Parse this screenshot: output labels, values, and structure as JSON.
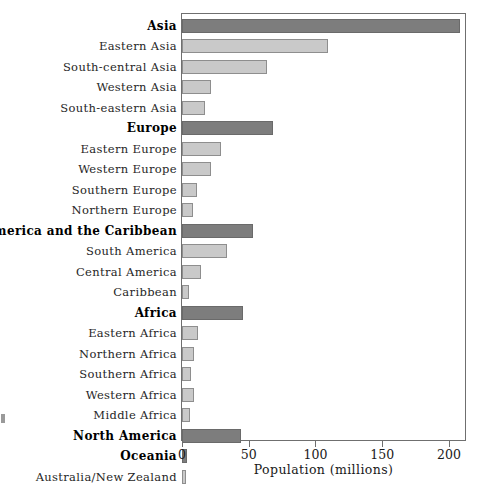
{
  "chart_data": {
    "type": "bar",
    "orientation": "horizontal",
    "title": "",
    "xlabel": "Population (millions)",
    "ylabel": "",
    "xlim": [
      0,
      212
    ],
    "xticks": [
      0,
      50,
      100,
      150,
      200
    ],
    "xticklabels": [
      "0",
      "50",
      "100",
      "150",
      "200"
    ],
    "grid": false,
    "legend": null,
    "colors": {
      "major_region_fill": "#7d7d7d",
      "sub_region_fill": "#c9c9c9",
      "bar_border": "#8e8e8e",
      "frame": "#6f6f6f",
      "background": "#ffffff"
    },
    "categories": [
      "Asia",
      "Eastern Asia",
      "South-central Asia",
      "Western Asia",
      "South-eastern Asia",
      "Europe",
      "Eastern Europe",
      "Western Europe",
      "Southern Europe",
      "Northern Europe",
      "Latin America and the Caribbean",
      "South America",
      "Central America",
      "Caribbean",
      "Africa",
      "Eastern Africa",
      "Northern Africa",
      "Southern Africa",
      "Western Africa",
      "Middle Africa",
      "North America",
      "Oceania",
      "Australia/New Zealand"
    ],
    "values": [
      208,
      109,
      64,
      22,
      17,
      68,
      29,
      22,
      11,
      8,
      53,
      34,
      14,
      5,
      46,
      12,
      9,
      7,
      9,
      6,
      44,
      4,
      3
    ],
    "levels": [
      "major",
      "sub",
      "sub",
      "sub",
      "sub",
      "major",
      "sub",
      "sub",
      "sub",
      "sub",
      "major",
      "sub",
      "sub",
      "sub",
      "major",
      "sub",
      "sub",
      "sub",
      "sub",
      "sub",
      "major",
      "major",
      "sub"
    ],
    "rows": [
      {
        "label": "Asia",
        "value": 208,
        "level": "major"
      },
      {
        "label": "Eastern Asia",
        "value": 109,
        "level": "sub"
      },
      {
        "label": "South-central Asia",
        "value": 64,
        "level": "sub"
      },
      {
        "label": "Western Asia",
        "value": 22,
        "level": "sub"
      },
      {
        "label": "South-eastern Asia",
        "value": 17,
        "level": "sub"
      },
      {
        "label": "Europe",
        "value": 68,
        "level": "major"
      },
      {
        "label": "Eastern Europe",
        "value": 29,
        "level": "sub"
      },
      {
        "label": "Western Europe",
        "value": 22,
        "level": "sub"
      },
      {
        "label": "Southern Europe",
        "value": 11,
        "level": "sub"
      },
      {
        "label": "Northern Europe",
        "value": 8,
        "level": "sub"
      },
      {
        "label": "Latin America and the Caribbean",
        "value": 53,
        "level": "major"
      },
      {
        "label": "South America",
        "value": 34,
        "level": "sub"
      },
      {
        "label": "Central America",
        "value": 14,
        "level": "sub"
      },
      {
        "label": "Caribbean",
        "value": 5,
        "level": "sub"
      },
      {
        "label": "Africa",
        "value": 46,
        "level": "major"
      },
      {
        "label": "Eastern Africa",
        "value": 12,
        "level": "sub"
      },
      {
        "label": "Northern Africa",
        "value": 9,
        "level": "sub"
      },
      {
        "label": "Southern Africa",
        "value": 7,
        "level": "sub"
      },
      {
        "label": "Western Africa",
        "value": 9,
        "level": "sub"
      },
      {
        "label": "Middle Africa",
        "value": 6,
        "level": "sub"
      },
      {
        "label": "North America",
        "value": 44,
        "level": "major"
      },
      {
        "label": "Oceania",
        "value": 4,
        "level": "major"
      },
      {
        "label": "Australia/New Zealand",
        "value": 3,
        "level": "sub"
      }
    ]
  },
  "axis": {
    "xlabel": "Population (millions)",
    "ticks": [
      "0",
      "50",
      "100",
      "150",
      "200"
    ]
  }
}
